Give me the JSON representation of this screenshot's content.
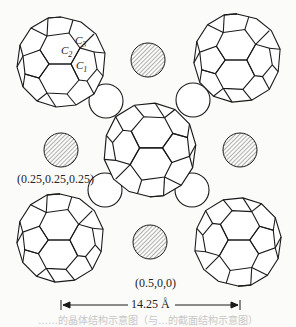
{
  "figure": {
    "atom_labels": {
      "c1": "C",
      "c1_sub": "1",
      "c2": "C",
      "c2_sub": "2",
      "c3": "C",
      "c3_sub": "3"
    },
    "site_labels": {
      "tetrahedral": "(0.25,0.25,0.25)",
      "octahedral": "(0.5,0,0)"
    },
    "scale_bar": {
      "label": "14.25 Å"
    },
    "caption": "……的晶体结构示意图（与…的截面结构示意图）",
    "colors": {
      "line": "#1a1a1a",
      "hatch": "#555555",
      "background": "#fbfbf9"
    },
    "fullerenes": [
      {
        "name": "top-left",
        "cx": 61,
        "cy": 62,
        "r": 45
      },
      {
        "name": "top-right",
        "cx": 237,
        "cy": 58,
        "r": 44
      },
      {
        "name": "center",
        "cx": 150,
        "cy": 150,
        "r": 47
      },
      {
        "name": "bottom-left",
        "cx": 60,
        "cy": 238,
        "r": 44
      },
      {
        "name": "bottom-right",
        "cx": 238,
        "cy": 242,
        "r": 44
      }
    ],
    "octahedral_ions": [
      {
        "cx": 148,
        "cy": 60
      },
      {
        "cx": 61,
        "cy": 150
      },
      {
        "cx": 240,
        "cy": 150
      },
      {
        "cx": 150,
        "cy": 242
      }
    ],
    "tetrahedral_ions": [
      {
        "cx": 106,
        "cy": 101
      },
      {
        "cx": 193,
        "cy": 100
      },
      {
        "cx": 105,
        "cy": 190
      },
      {
        "cx": 192,
        "cy": 190
      }
    ]
  }
}
